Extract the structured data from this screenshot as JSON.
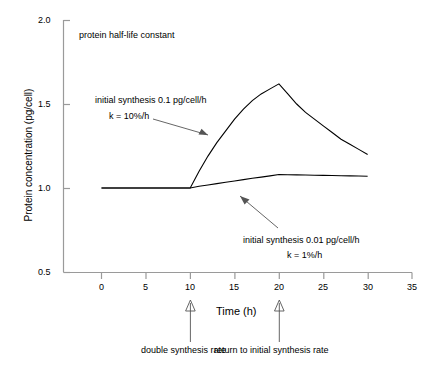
{
  "chart_data": {
    "type": "line",
    "title": "",
    "subtitle": "",
    "xlabel": "Time (h)",
    "ylabel": "Protein concentration (pg/cell)",
    "xlim": [
      -2,
      35
    ],
    "ylim": [
      0.5,
      2.0
    ],
    "xticks": [
      0,
      5,
      10,
      15,
      20,
      25,
      30,
      35
    ],
    "xtick_labels": [
      "0",
      "5",
      "10",
      "15",
      "20",
      "25",
      "30",
      "35"
    ],
    "yticks": [
      0.5,
      1.0,
      1.5,
      2.0
    ],
    "ytick_labels": [
      "0.5",
      "1.0",
      "1.5",
      "2.0"
    ],
    "grid": false,
    "legend_position": "none",
    "series": [
      {
        "name": "initial synthesis 0.1 pg/cell/h, k = 10%/h",
        "x": [
          0,
          1,
          2,
          3,
          4,
          5,
          6,
          7,
          8,
          9,
          10,
          11,
          12,
          13,
          14,
          15,
          16,
          17,
          18,
          19,
          20,
          21,
          22,
          23,
          24,
          25,
          26,
          27,
          28,
          29,
          30
        ],
        "y": [
          1.0,
          1.0,
          1.0,
          1.0,
          1.0,
          1.0,
          1.0,
          1.0,
          1.0,
          1.0,
          1.0,
          1.1,
          1.19,
          1.27,
          1.34,
          1.41,
          1.47,
          1.52,
          1.56,
          1.59,
          1.62,
          1.56,
          1.5,
          1.45,
          1.41,
          1.37,
          1.33,
          1.29,
          1.26,
          1.23,
          1.2
        ]
      },
      {
        "name": "initial synthesis 0.01 pg/cell/h, k = 1%/h",
        "x": [
          0,
          1,
          2,
          3,
          4,
          5,
          6,
          7,
          8,
          9,
          10,
          11,
          12,
          13,
          14,
          15,
          16,
          17,
          18,
          19,
          20,
          21,
          22,
          23,
          24,
          25,
          26,
          27,
          28,
          29,
          30
        ],
        "y": [
          1.0,
          1.0,
          1.0,
          1.0,
          1.0,
          1.0,
          1.0,
          1.0,
          1.0,
          1.0,
          1.0,
          1.01,
          1.018,
          1.026,
          1.034,
          1.042,
          1.05,
          1.058,
          1.065,
          1.072,
          1.08,
          1.079,
          1.078,
          1.077,
          1.076,
          1.075,
          1.074,
          1.073,
          1.072,
          1.071,
          1.07
        ]
      }
    ],
    "annotations": [
      {
        "key": "half_life",
        "text": "protein half-life constant",
        "x": 2.5,
        "y": 1.89
      },
      {
        "key": "upper_line1",
        "text": "initial synthesis 0.1 pg/cell/h",
        "x": 2.0,
        "y": 1.52
      },
      {
        "key": "upper_line2",
        "text": "k = 10%/h",
        "x": 3.5,
        "y": 1.43
      },
      {
        "key": "lower_line1",
        "text": "initial synthesis 0.01 pg/cell/h",
        "x": 17.5,
        "y": 0.79
      },
      {
        "key": "lower_line2",
        "text": "k = 1%/h",
        "x": 22.0,
        "y": 0.72
      },
      {
        "key": "double_rate",
        "text": "double synthesis rate",
        "x": 10,
        "y": 0.28
      },
      {
        "key": "return_rate",
        "text": "return to initial synthesis rate",
        "x": 20,
        "y": 0.28
      }
    ]
  },
  "axis": {
    "x_label": "Time (h)",
    "y_label": "Protein concentration (pg/cell)"
  },
  "labels": {
    "half_life": "protein half-life constant",
    "upper_line1": "initial synthesis 0.1 pg/cell/h",
    "upper_line2": "k = 10%/h",
    "lower_line1": "initial synthesis 0.01 pg/cell/h",
    "lower_line2": "k = 1%/h",
    "double_rate": "double synthesis rate",
    "return_rate": "return to initial synthesis rate"
  },
  "ticks": {
    "x": [
      "0",
      "5",
      "10",
      "15",
      "20",
      "25",
      "30",
      "35"
    ],
    "y": [
      "2.0",
      "1.5",
      "1.0",
      "0.5"
    ]
  },
  "colors": {
    "line": "#000000",
    "axis": "#808080",
    "background": "#ffffff"
  }
}
